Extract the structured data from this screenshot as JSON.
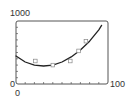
{
  "chart_data": {
    "type": "scatter",
    "title": "",
    "xlabel": "",
    "ylabel": "",
    "xlim": [
      0,
      100
    ],
    "ylim": [
      0,
      1000
    ],
    "x_tick_labels": [
      "0",
      "100"
    ],
    "y_tick_labels": [
      "0",
      "1000"
    ],
    "x_minor_ticks": 10,
    "y_minor_ticks": 10,
    "grid": false,
    "legend": null,
    "series": [
      {
        "name": "data points",
        "type": "scatter",
        "marker": "square-open",
        "x": [
          21,
          40,
          59,
          68,
          76
        ],
        "y": [
          365,
          300,
          365,
          525,
          680
        ]
      },
      {
        "name": "fitted curve",
        "type": "line",
        "x": [
          0,
          10,
          20,
          30,
          40,
          50,
          60,
          70,
          80,
          90,
          93
        ],
        "y": [
          445,
          350,
          300,
          285,
          300,
          350,
          430,
          540,
          680,
          860,
          930
        ]
      }
    ]
  },
  "labels": {
    "y_max": "1000",
    "y_min": "0",
    "x_min": "0",
    "x_max": "100"
  },
  "colors": {
    "frame": "#555555",
    "curve": "#222222",
    "marker": "#888888",
    "text": "#333333"
  }
}
